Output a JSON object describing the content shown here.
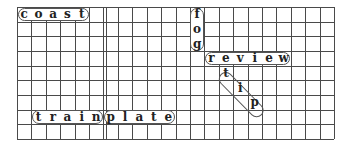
{
  "puzzle": {
    "type": "word-search",
    "grid": {
      "columns": 22,
      "rows": 9,
      "line_color": "#4a4a4a",
      "double_line_after_column": 6
    },
    "words": [
      {
        "word": "coast",
        "direction": "horizontal",
        "start": [
          0,
          0
        ],
        "letters": [
          "c",
          "o",
          "a",
          "s",
          "t"
        ]
      },
      {
        "word": "fog",
        "direction": "vertical",
        "start": [
          12,
          0
        ],
        "letters": [
          "f",
          "o",
          "g"
        ]
      },
      {
        "word": "review",
        "direction": "horizontal",
        "start": [
          13,
          3
        ],
        "letters": [
          "r",
          "e",
          "v",
          "i",
          "e",
          "w"
        ]
      },
      {
        "word": "tip",
        "direction": "diagonal",
        "start": [
          14,
          4
        ],
        "letters": [
          "t",
          "i",
          "p"
        ]
      },
      {
        "word": "train",
        "direction": "horizontal",
        "start": [
          1,
          7
        ],
        "letters": [
          "t",
          "r",
          "a",
          "i",
          "n"
        ]
      },
      {
        "word": "plate",
        "direction": "horizontal",
        "start": [
          6,
          7
        ],
        "letters": [
          "p",
          "l",
          "a",
          "t",
          "e"
        ]
      }
    ]
  }
}
